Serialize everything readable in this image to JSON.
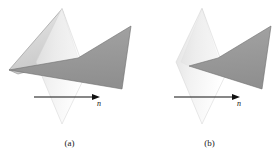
{
  "figure": {
    "type": "geometry-diagram",
    "background": "#ffffff",
    "panels": [
      {
        "id": "a",
        "caption": "(a)",
        "description": "Polygon crossing the plane",
        "normal_label": "n",
        "plane": {
          "name": "vertical-plane",
          "fill_light": "#f4f4f4",
          "fill_dark": "#dcdcdc",
          "points": "62,8 86,74 62,124 36,62"
        },
        "polygon_back": {
          "name": "polygon-back-half",
          "fill": "#d8d8d8",
          "stroke": "#8a8a8a",
          "points": "62,9 78,58 18,74 9,70"
        },
        "polygon_front": {
          "name": "polygon-front-half",
          "fill": "#9b9b9b",
          "stroke": "#6e6e6e",
          "points": "131,26 122,89 9,70 78,58"
        },
        "arrow": {
          "name": "normal-arrow",
          "x1": 34,
          "y1": 97,
          "x2": 95,
          "y2": 97,
          "color": "#111111",
          "label_x": 99,
          "label_y": 104
        }
      },
      {
        "id": "b",
        "caption": "(b)",
        "description": "Polygon clipped at the plane",
        "normal_label": "n",
        "plane": {
          "name": "vertical-plane",
          "fill_light": "#f4f4f4",
          "fill_dark": "#dcdcdc",
          "points": "62,8 86,74 62,124 36,62"
        },
        "polygon_back": {
          "name": "polygon-back-half",
          "fill": "#e2e2e2",
          "stroke": "#9c9c9c",
          "points": "62,9 78,58 49,66 41,62"
        },
        "polygon_front": {
          "name": "polygon-front-half",
          "fill": "#9b9b9b",
          "stroke": "#6e6e6e",
          "points": "131,26 122,89 49,66 78,58"
        },
        "arrow": {
          "name": "normal-arrow",
          "x1": 34,
          "y1": 97,
          "x2": 95,
          "y2": 97,
          "color": "#111111",
          "label_x": 99,
          "label_y": 104
        }
      }
    ]
  }
}
